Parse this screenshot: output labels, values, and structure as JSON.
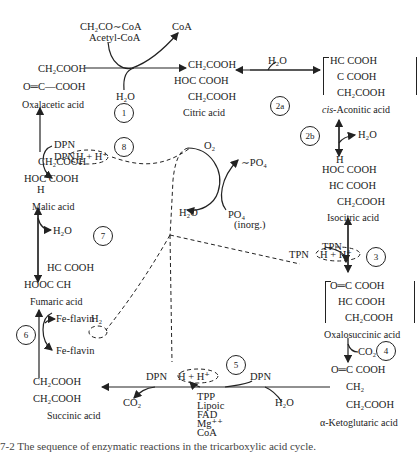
{
  "compounds": {
    "acetyl_coa": {
      "formula": "CH₂CO∼CoA",
      "name": "Acetyl-CoA"
    },
    "coa": "CoA",
    "oxalacetic": {
      "line1": "CH₂COOH",
      "line2": "O═C—COOH",
      "name": "Oxalacetic acid"
    },
    "citric": {
      "line1": "CH₂COOH",
      "line2": "HOC COOH",
      "line3": "CH₂COOH",
      "name": "Citric acid"
    },
    "cis_aconitic": {
      "line1": "HC COOH",
      "line2": "C COOH",
      "line3": "CH₂COOH",
      "name_prefix": "cis",
      "name": "-Aconitic acid"
    },
    "isocitric": {
      "line0": "H",
      "line1": "HOC COOH",
      "line2": "HC COOH",
      "line3": "CH₂COOH",
      "name": "Isocitric acid"
    },
    "oxalosuccinic": {
      "line1": "O═C COOH",
      "line2": "HC COOH",
      "line3": "CH₂COOH",
      "name": "Oxalosuccinic acid"
    },
    "ketoglutaric": {
      "line1": "O═C COOH",
      "line2": "CH₂",
      "line3": "CH₂COOH",
      "name": "α-Ketoglutaric acid"
    },
    "succinic": {
      "line1": "CH₂COOH",
      "line2": "CH₂COOH",
      "name": "Succinic acid"
    },
    "fumaric": {
      "line1": "HC COOH",
      "line2": "HOOC CH",
      "name": "Fumaric acid"
    },
    "malic": {
      "line1": "CH₂COOH",
      "line2": "HOC COOH",
      "line3": "H",
      "name": "Malic acid"
    }
  },
  "cofactors": {
    "h2o_1": "H₂O",
    "h2o_2a": "H₂O",
    "h2o_2b": "H₂O",
    "h2o_7": "H₂O",
    "h2o_5": "H₂O",
    "h2o_resp": "H₂O",
    "dpn_8": "DPN",
    "dpnh_8": "DPN",
    "h_8": "H + H⁺",
    "tpn_3": "TPN",
    "tpnh_3": "TPN",
    "h_3": "H + H⁺",
    "co2_4": "CO₂",
    "co2_5": "CO₂",
    "dpn_5": "DPN",
    "dpnh_5": "DPN",
    "h_5": "H + H⁺",
    "fe_flavin_h2": "Fe-flavin",
    "h2_6": "H₂",
    "fe_flavin": "Fe-flavin",
    "o2": "O₂",
    "po4_high": "∼PO₄",
    "po4_inorg": "PO₄",
    "inorg": "(inorg.)",
    "step5_cofactors": [
      "TPP",
      "Lipoic",
      "FAD",
      "Mg⁺⁺",
      "CoA"
    ]
  },
  "steps": [
    "1",
    "2a",
    "2b",
    "3",
    "4",
    "5",
    "6",
    "7",
    "8"
  ],
  "caption": "7-2  The sequence of enzymatic reactions in the tricarboxylic acid cycle."
}
